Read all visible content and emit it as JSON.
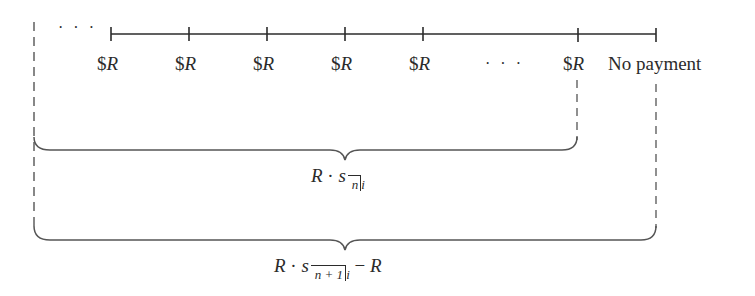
{
  "timeline": {
    "leading_ellipsis": "· · ·",
    "payments": [
      {
        "label_prefix": "$",
        "label_var": "R"
      },
      {
        "label_prefix": "$",
        "label_var": "R"
      },
      {
        "label_prefix": "$",
        "label_var": "R"
      },
      {
        "label_prefix": "$",
        "label_var": "R"
      },
      {
        "label_prefix": "$",
        "label_var": "R"
      }
    ],
    "middle_ellipsis": "· · ·",
    "last_payment": {
      "label_prefix": "$",
      "label_var": "R"
    },
    "final_label": "No payment"
  },
  "braces": {
    "upper": {
      "coef": "R",
      "dot": "·",
      "fn": "s",
      "subscript_n": "n",
      "subscript_i": "i"
    },
    "lower": {
      "coef": "R",
      "dot": "·",
      "fn": "s",
      "subscript_n": "n + 1",
      "subscript_i": "i",
      "minus": "−",
      "tail": "R"
    }
  },
  "colors": {
    "line": "#2b2b2b",
    "dashed": "#555555"
  }
}
